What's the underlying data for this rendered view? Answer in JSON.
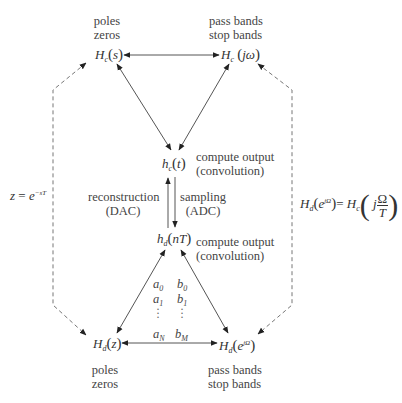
{
  "diagram": {
    "nodes": {
      "analog_tf": {
        "base": "H",
        "sub": "c",
        "arg": "s"
      },
      "analog_freq": {
        "base": "H",
        "sub": "c",
        "arg": "jω"
      },
      "analog_impulse": {
        "base": "h",
        "sub": "c",
        "arg": "t"
      },
      "digital_impulse": {
        "base": "h",
        "sub": "d",
        "arg": "nT"
      },
      "digital_tf": {
        "base": "H",
        "sub": "d",
        "arg": "z"
      },
      "digital_freq": {
        "base": "H",
        "sub": "d",
        "arg_base": "e",
        "arg_sup": "jΩ"
      }
    },
    "labels": {
      "top_left_1": "poles",
      "top_left_2": "zeros",
      "top_right_1": "pass bands",
      "top_right_2": "stop bands",
      "bottom_left_1": "poles",
      "bottom_left_2": "zeros",
      "bottom_right_1": "pass bands",
      "bottom_right_2": "stop bands",
      "compute_1a": "compute output",
      "compute_1b": "(convolution)",
      "compute_2a": "compute output",
      "compute_2b": "(convolution)",
      "reconstruction_1": "reconstruction",
      "reconstruction_2": "(DAC)",
      "sampling_1": "sampling",
      "sampling_2": "(ADC)"
    },
    "coefficients": {
      "a": [
        {
          "b": "a",
          "s": "0"
        },
        {
          "b": "a",
          "s": "1"
        },
        {
          "b": "a",
          "s": "N"
        }
      ],
      "b": [
        {
          "b": "b",
          "s": "0"
        },
        {
          "b": "b",
          "s": "1"
        },
        {
          "b": "b",
          "s": "M"
        }
      ]
    },
    "equations": {
      "left": {
        "lhs": "z",
        "eq": "=",
        "base": "e",
        "sup": "−sT"
      },
      "right": {
        "lhs_base": "H",
        "lhs_sub": "d",
        "lhs_arg_base": "e",
        "lhs_arg_sup": "jΩ",
        "eq": "=",
        "rhs_base": "H",
        "rhs_sub": "c",
        "rhs_j": "j",
        "rhs_num": "Ω",
        "rhs_den": "T"
      }
    },
    "colors": {
      "line": "#555555",
      "dashed": "#777777",
      "text": "#444444"
    }
  }
}
